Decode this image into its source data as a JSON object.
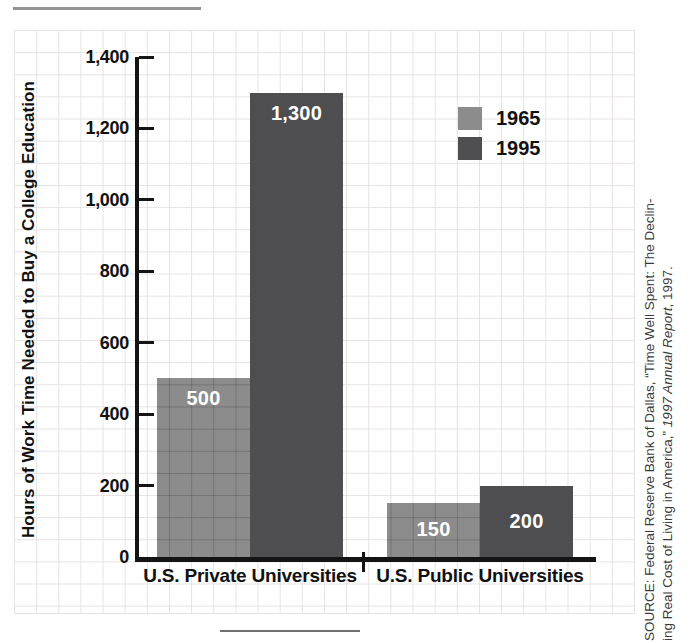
{
  "chart_data": {
    "type": "bar",
    "title": "",
    "xlabel": "",
    "ylabel": "Hours of Work Time Needed to Buy a College Education",
    "categories": [
      "U.S. Private Universities",
      "U.S. Public Universities"
    ],
    "series": [
      {
        "name": "1965",
        "color": "#8c8c8c",
        "values": [
          500,
          150
        ],
        "value_labels": [
          "500",
          "150"
        ]
      },
      {
        "name": "1995",
        "color": "#4e4e51",
        "values": [
          1300,
          200
        ],
        "value_labels": [
          "1,300",
          "200"
        ]
      }
    ],
    "ylim": [
      0,
      1400
    ],
    "y_tick_step": 200,
    "y_tick_labels": [
      "0",
      "200",
      "400",
      "600",
      "800",
      "1,000",
      "1,200",
      "1,400"
    ],
    "grid": true,
    "legend_position": "upper right"
  },
  "colors": {
    "axis": "#141414",
    "grid_line": "#e7e2e2",
    "bar_1965": "#8c8c8c",
    "bar_1995": "#4e4e51",
    "bar_label_text": "#ffffff"
  },
  "source_note": {
    "line1": "SOURCE: Federal Reserve Bank of Dallas, “Time Well Spent: The Declin-",
    "line2_prefix": "ing Real Cost of Living in America,” ",
    "line2_italic": "1997 Annual Report",
    "line2_suffix": ", 1997."
  }
}
